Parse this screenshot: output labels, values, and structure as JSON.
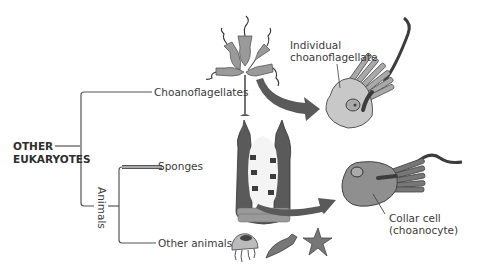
{
  "diagram": {
    "title": "",
    "root": {
      "line1": "OTHER",
      "line2": "EUKARYOTES"
    },
    "clades": {
      "choanoflagellates": "Choanoflagellates",
      "animals": "Animals",
      "sponges": "Sponges",
      "other_animals": "Other animals"
    },
    "callouts": {
      "individual_line1": "Individual",
      "individual_line2": "choanoflagellate",
      "collar_line1": "Collar cell",
      "collar_line2": "(choanocyte)"
    },
    "colors": {
      "line": "#555555",
      "arrow": "#5a5a5a",
      "cell_fill": "#c8c8c8",
      "collar_cell_fill": "#8f8f8f",
      "dark": "#3c3c3c"
    }
  }
}
